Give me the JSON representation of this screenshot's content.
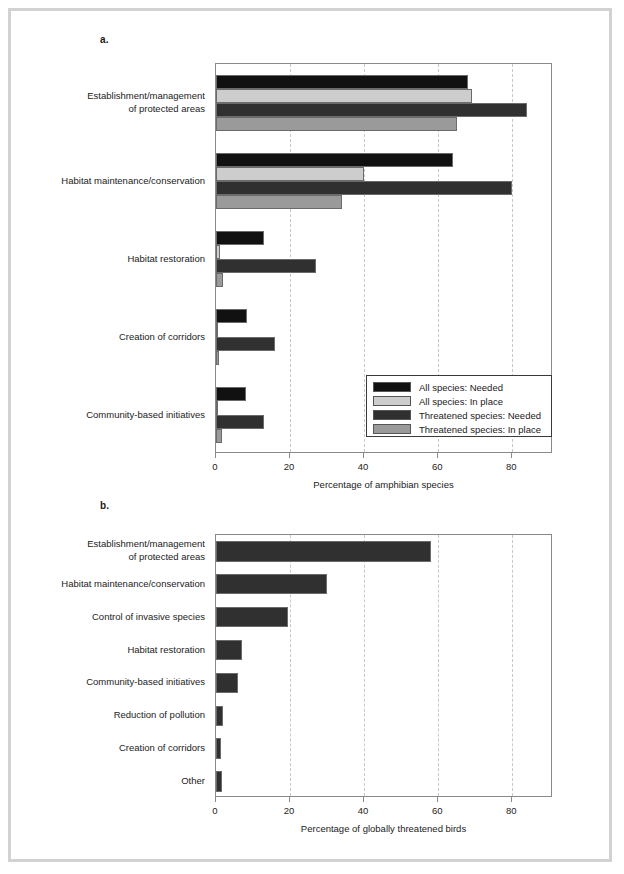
{
  "figure": {
    "panel_a_letter": "a.",
    "panel_b_letter": "b."
  },
  "chart_data": [
    {
      "panel": "a.",
      "type": "bar",
      "orientation": "horizontal",
      "title": "",
      "xlabel": "Percentage of amphibian species",
      "ylabel": "",
      "xlim": [
        0,
        91
      ],
      "xticks": [
        0,
        20,
        40,
        60,
        80
      ],
      "xtick_labels": [
        "0",
        "20",
        "40",
        "60",
        "80"
      ],
      "grid": "vertical-dashed",
      "legend_position": "lower-right-inside",
      "categories": [
        "Establishment/management of protected areas",
        "Habitat maintenance/conservation",
        "Habitat restoration",
        "Creation of corridors",
        "Community-based initiatives"
      ],
      "category_lines": [
        [
          "Establishment/management",
          "of protected areas"
        ],
        [
          "Habitat maintenance/conservation"
        ],
        [
          "Habitat restoration"
        ],
        [
          "Creation of corridors"
        ],
        [
          "Community-based initiatives"
        ]
      ],
      "series": [
        {
          "name": "All species: Needed",
          "color": "#111111",
          "values": [
            68,
            64,
            13,
            8.5,
            8
          ]
        },
        {
          "name": "All species: In place",
          "color": "#cdcdcd",
          "values": [
            69,
            40,
            1,
            0.6,
            0.4
          ]
        },
        {
          "name": "Threatened species: Needed",
          "color": "#303030",
          "values": [
            84,
            80,
            27,
            16,
            13
          ]
        },
        {
          "name": "Threatened species: In place",
          "color": "#9a9a9a",
          "values": [
            65,
            34,
            2,
            0.8,
            1.6
          ]
        }
      ]
    },
    {
      "panel": "b.",
      "type": "bar",
      "orientation": "horizontal",
      "title": "",
      "xlabel": "Percentage of globally threatened birds",
      "ylabel": "",
      "xlim": [
        0,
        91
      ],
      "xticks": [
        0,
        20,
        40,
        60,
        80
      ],
      "xtick_labels": [
        "0",
        "20",
        "40",
        "60",
        "80"
      ],
      "grid": "vertical-dashed",
      "legend_position": "none",
      "categories": [
        "Establishment/management of protected areas",
        "Habitat maintenance/conservation",
        "Control of invasive species",
        "Habitat restoration",
        "Community-based initiatives",
        "Reduction of pollution",
        "Creation of corridors",
        "Other"
      ],
      "category_lines": [
        [
          "Establishment/management",
          "of protected areas"
        ],
        [
          "Habitat maintenance/conservation"
        ],
        [
          "Control of invasive species"
        ],
        [
          "Habitat restoration"
        ],
        [
          "Community-based initiatives"
        ],
        [
          "Reduction of pollution"
        ],
        [
          "Creation of corridors"
        ],
        [
          "Other"
        ]
      ],
      "series": [
        {
          "name": "Globally threatened birds",
          "color": "#303030",
          "values": [
            58,
            30,
            19.5,
            7,
            6,
            2,
            1.4,
            1.6
          ]
        }
      ]
    }
  ]
}
